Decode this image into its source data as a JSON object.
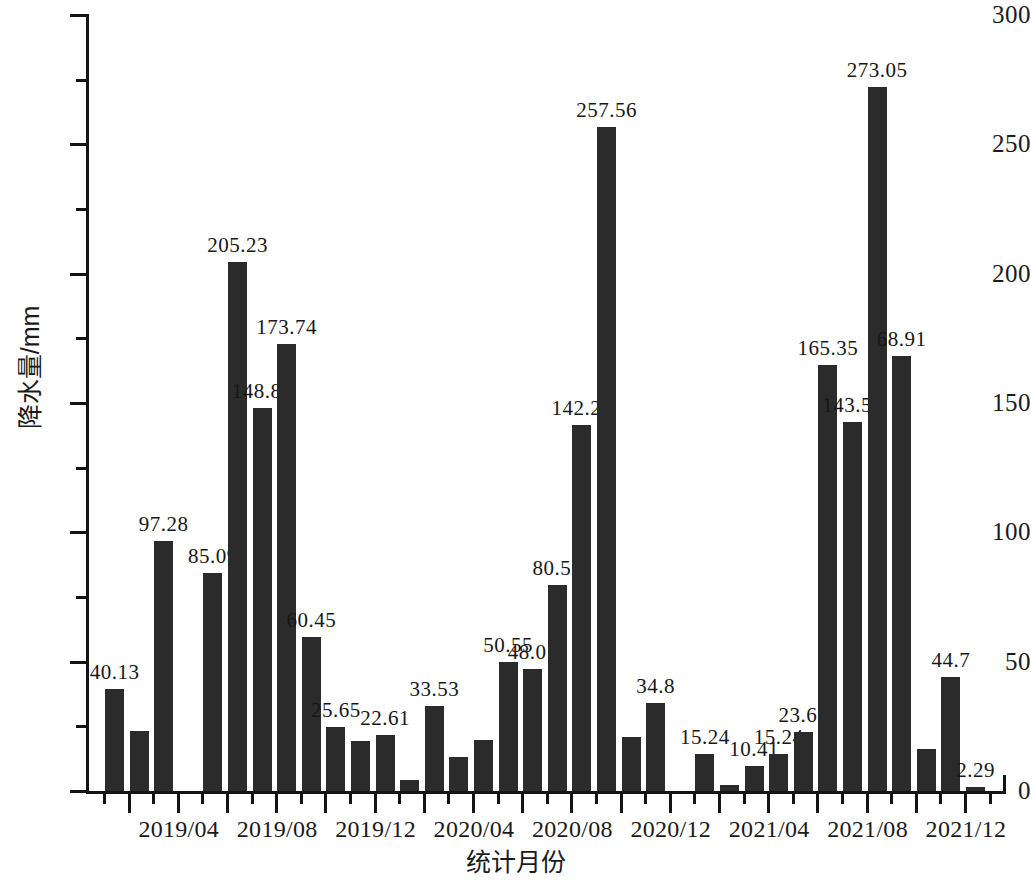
{
  "chart_data": {
    "type": "bar",
    "title": "",
    "xlabel": "统计月份",
    "ylabel": "降水量/mm",
    "ylim": [
      0,
      300
    ],
    "y_ticks": [
      0,
      50,
      100,
      150,
      200,
      250,
      300
    ],
    "y_minor_ticks": [
      25,
      75,
      125,
      175,
      225,
      275
    ],
    "grid": false,
    "legend": null,
    "bar_color": "#2b2b2b",
    "axis_color": "#141414",
    "x_tick_labels": [
      "2019/04",
      "2019/08",
      "2019/12",
      "2020/04",
      "2020/08",
      "2020/12",
      "2021/04",
      "2021/08",
      "2021/12"
    ],
    "categories": [
      "2019/01",
      "2019/02",
      "2019/03",
      "2019/04",
      "2019/05",
      "2019/06",
      "2019/07",
      "2019/08",
      "2019/09",
      "2019/10",
      "2019/11",
      "2019/12",
      "2020/01",
      "2020/02",
      "2020/03",
      "2020/04",
      "2020/05",
      "2020/06",
      "2020/07",
      "2020/08",
      "2020/09",
      "2020/10",
      "2020/11",
      "2020/12",
      "2021/01",
      "2021/02",
      "2021/03",
      "2021/04",
      "2021/05",
      "2021/06",
      "2021/07",
      "2021/08",
      "2021/09",
      "2021/10",
      "2021/11",
      "2021/12"
    ],
    "values": [
      40.13,
      24.0,
      97.28,
      0.8,
      85.09,
      205.23,
      148.84,
      173.74,
      60.45,
      25.65,
      20.0,
      22.61,
      5.0,
      33.53,
      14.0,
      20.5,
      50.55,
      48.01,
      80.52,
      142.24,
      257.56,
      21.5,
      34.8,
      0.0,
      15.24,
      3.0,
      10.41,
      15.24,
      23.62,
      165.35,
      143.51,
      273.05,
      168.91,
      17.0,
      44.7,
      2.29
    ],
    "point_labels": [
      "40.13",
      "",
      "97.28",
      "",
      "85.09",
      "205.23",
      "148.84",
      "173.74",
      "60.45",
      "25.65",
      "",
      "22.61",
      "",
      "33.53",
      "",
      "",
      "50.55",
      "48.01",
      "80.52",
      "142.24",
      "257.56",
      "",
      "34.8",
      "",
      "15.24",
      "",
      "10.41",
      "15.24",
      "23.62",
      "165.35",
      "143.51",
      "273.05",
      "68.91",
      "",
      "44.7",
      "2.29"
    ]
  }
}
